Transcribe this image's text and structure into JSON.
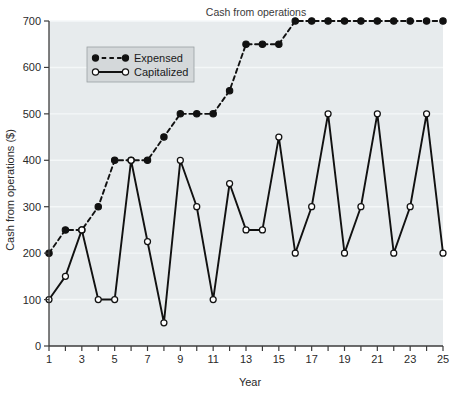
{
  "chart_data": {
    "type": "line",
    "title": "Cash from operations",
    "xlabel": "Year",
    "ylabel": "Cash from operations ($)",
    "x": [
      1,
      2,
      3,
      4,
      5,
      6,
      7,
      8,
      9,
      10,
      11,
      12,
      13,
      14,
      15,
      16,
      17,
      18,
      19,
      20,
      21,
      22,
      23,
      24,
      25
    ],
    "xlim": [
      1,
      25
    ],
    "ylim": [
      0,
      700
    ],
    "xticks": [
      1,
      2,
      3,
      4,
      5,
      6,
      7,
      8,
      9,
      10,
      11,
      12,
      13,
      14,
      15,
      16,
      17,
      18,
      19,
      20,
      21,
      22,
      23,
      24,
      25
    ],
    "xtick_labels": [
      "1",
      "",
      "3",
      "",
      "5",
      "",
      "7",
      "",
      "9",
      "",
      "11",
      "",
      "13",
      "",
      "15",
      "",
      "17",
      "",
      "19",
      "",
      "21",
      "",
      "23",
      "",
      "25"
    ],
    "yticks": [
      0,
      100,
      200,
      300,
      400,
      500,
      600,
      700
    ],
    "ytick_labels": [
      "0",
      "100",
      "200",
      "300",
      "400",
      "500",
      "600",
      "700"
    ],
    "grid": true,
    "legend_position": "upper left",
    "series": [
      {
        "name": "Expensed",
        "marker": "filled-circle",
        "linestyle": "dashed",
        "color": "#111111",
        "values": [
          200,
          250,
          250,
          300,
          400,
          400,
          400,
          450,
          500,
          500,
          500,
          550,
          650,
          650,
          650,
          700,
          700,
          700,
          700,
          700,
          700,
          700,
          700,
          700,
          700
        ]
      },
      {
        "name": "Capitalized",
        "marker": "open-circle",
        "linestyle": "solid",
        "color": "#111111",
        "values": [
          100,
          150,
          250,
          100,
          100,
          400,
          225,
          50,
          400,
          300,
          100,
          350,
          250,
          250,
          450,
          200,
          300,
          500,
          200,
          300,
          500,
          200,
          300,
          500,
          200
        ]
      }
    ]
  },
  "legend": {
    "entries": [
      {
        "label": "Expensed"
      },
      {
        "label": "Capitalized"
      }
    ]
  },
  "style": {
    "plot_bg": "#e7ebed",
    "grid_color": "#f4f7f8",
    "axis_color": "#3c3c3c",
    "ink": "#111111",
    "legend_bg": "#d4d8da",
    "page_bg": "#ffffff"
  }
}
